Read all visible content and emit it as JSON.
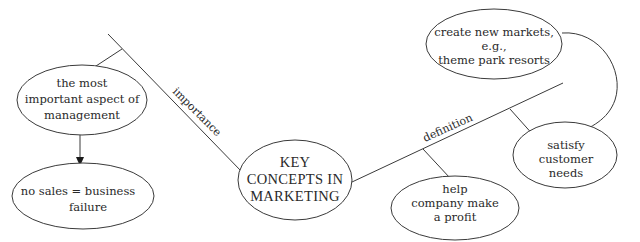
{
  "diagram": {
    "type": "concept-map",
    "central": {
      "lines": [
        "KEY",
        "CONCEPTS IN",
        "MARKETING"
      ]
    },
    "edges": {
      "importance": "importance",
      "definition": "definition"
    },
    "nodes": {
      "most_important": {
        "lines": [
          "the most",
          "important aspect of",
          "management"
        ]
      },
      "no_sales": {
        "lines": [
          "no sales = business",
          "failure"
        ]
      },
      "create_markets": {
        "lines": [
          "create new markets,",
          "e.g.,",
          "theme park resorts"
        ]
      },
      "satisfy_needs": {
        "lines": [
          "satisfy",
          "customer",
          "needs"
        ]
      },
      "help_profit": {
        "lines": [
          "help",
          "company make",
          "a profit"
        ]
      }
    },
    "colors": {
      "line": "#3a3a3a",
      "text": "#2a2a2a",
      "background": "#ffffff"
    }
  }
}
